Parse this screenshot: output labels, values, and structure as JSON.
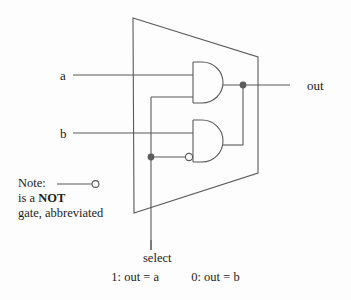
{
  "diagram": {
    "colors": {
      "background": "#fdfdfd",
      "line": "#5a5a5a",
      "dot": "#5c5c5c",
      "text": "#1c1c1c"
    },
    "inputs": [
      {
        "id": "a",
        "label": "a"
      },
      {
        "id": "b",
        "label": "b"
      }
    ],
    "outputs": [
      {
        "id": "out",
        "label": "out"
      }
    ],
    "control": {
      "label": "select"
    },
    "gates": [
      {
        "id": "and-top",
        "type": "AND",
        "inverted_input": false
      },
      {
        "id": "and-bottom",
        "type": "AND",
        "inverted_input": true
      }
    ],
    "note": {
      "word": "Note:",
      "legend_icon": "not-gate-bubble",
      "line2_prefix": "is  a  ",
      "line2_bold": "NOT",
      "line3": "gate, abbreviated"
    },
    "caption": {
      "left": "1:  out  =  a",
      "right": "0:  out  =  b"
    }
  }
}
